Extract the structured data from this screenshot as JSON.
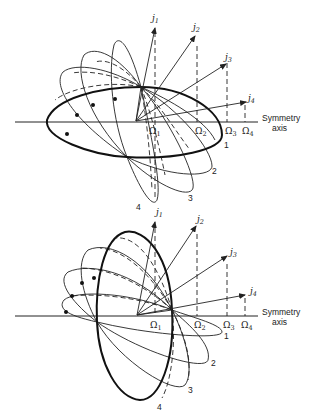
{
  "figure": {
    "panels": [
      {
        "id": "top",
        "axis_label_line1": "Symmetry",
        "axis_label_line2": "axis",
        "vectors": [
          {
            "label": "j",
            "sub": "1"
          },
          {
            "label": "j",
            "sub": "2"
          },
          {
            "label": "j",
            "sub": "3"
          },
          {
            "label": "j",
            "sub": "4"
          }
        ],
        "projections": [
          {
            "label": "Ω",
            "sub": "1"
          },
          {
            "label": "Ω",
            "sub": "2"
          },
          {
            "label": "Ω",
            "sub": "3"
          },
          {
            "label": "Ω",
            "sub": "4"
          }
        ],
        "orbit_labels": [
          "1",
          "2",
          "3",
          "4"
        ],
        "bold_orbit": "1"
      },
      {
        "id": "bottom",
        "axis_label_line1": "Symmetry",
        "axis_label_line2": "axis",
        "vectors": [
          {
            "label": "j",
            "sub": "1"
          },
          {
            "label": "j",
            "sub": "2"
          },
          {
            "label": "j",
            "sub": "3"
          },
          {
            "label": "j",
            "sub": "4"
          }
        ],
        "projections": [
          {
            "label": "Ω",
            "sub": "1"
          },
          {
            "label": "Ω",
            "sub": "2"
          },
          {
            "label": "Ω",
            "sub": "3"
          },
          {
            "label": "Ω",
            "sub": "4"
          }
        ],
        "orbit_labels": [
          "1",
          "2",
          "3",
          "4"
        ],
        "bold_orbit": "4"
      }
    ]
  }
}
